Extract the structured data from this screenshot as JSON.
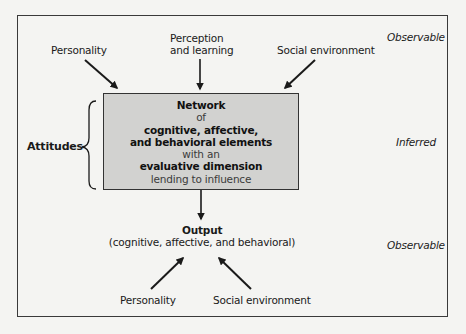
{
  "diagram": {
    "type": "attitude-network-flow",
    "zones": {
      "top": "Observable",
      "middle": "Inferred",
      "bottom": "Observable"
    },
    "inputs_top": [
      {
        "id": "personality",
        "label": "Personality"
      },
      {
        "id": "perception",
        "label_line1": "Perception",
        "label_line2": "and learning"
      },
      {
        "id": "social",
        "label": "Social environment"
      }
    ],
    "attitudes_label": "Attitudes",
    "core_box": {
      "lines": [
        {
          "text": "Network",
          "style": "bold"
        },
        {
          "text": "of",
          "style": "light"
        },
        {
          "text": "cognitive, affective,",
          "style": "bold"
        },
        {
          "text": "and behavioral elements",
          "style": "bold"
        },
        {
          "text": "with an",
          "style": "light"
        },
        {
          "text": "evaluative dimension",
          "style": "bold"
        },
        {
          "text": "lending to influence",
          "style": "light"
        }
      ]
    },
    "output": {
      "title": "Output",
      "subtitle": "(cognitive, affective, and behavioral)"
    },
    "inputs_bottom": [
      {
        "id": "personality",
        "label": "Personality"
      },
      {
        "id": "social",
        "label": "Social environment"
      }
    ],
    "colors": {
      "box_fill": "#d2d2d0",
      "stroke": "#1a1a1a",
      "background": "#f4f4f2"
    }
  }
}
